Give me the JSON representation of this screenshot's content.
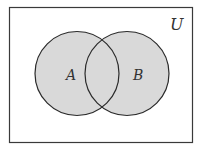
{
  "diagram": {
    "type": "venn",
    "universe_label": "U",
    "sets": [
      {
        "label": "A",
        "shaded": true
      },
      {
        "label": "B",
        "shaded": true
      }
    ],
    "shaded_region": "A ∪ B",
    "colors": {
      "fill": "#d9d9d9",
      "stroke": "#2a2a2a",
      "background": "#ffffff"
    }
  }
}
